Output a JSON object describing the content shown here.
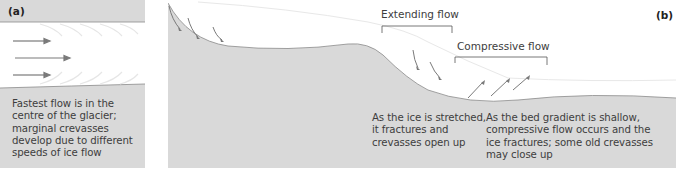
{
  "panel_a": {
    "label": "(a)",
    "caption": "Fastest flow is in the centre of the glacier; marginal crevasses develop due to different speeds of ice flow",
    "caption_lines": [
      "Fastest flow is in the",
      "centre of the glacier;",
      "marginal crevasses",
      "develop due to different",
      "speeds of ice flow"
    ]
  },
  "panel_b": {
    "label": "(b)",
    "extending_heading": "Extending flow",
    "compressive_heading": "Compressive flow",
    "extending_caption_lines": [
      "As the ice is stretched,",
      "it fractures and",
      "crevasses open up"
    ],
    "compressive_caption_lines": [
      "As the bed gradient is shallow,",
      "compressive flow occurs and the",
      "ice fractures; some old crevasses",
      "may close up"
    ]
  },
  "colors": {
    "bed": "#d9d9d9",
    "ice": "#ffffff",
    "arrow": "#7a7a7a",
    "outline": "#8a8a8a"
  }
}
